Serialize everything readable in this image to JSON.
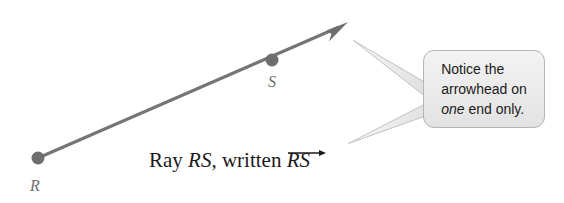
{
  "figure": {
    "name": "ray-diagram",
    "caption_prefix": "Ray ",
    "caption_points": "RS",
    "caption_middle": ", written ",
    "caption_vector": "RS",
    "points": [
      {
        "id": "R",
        "label": "R",
        "x": 38,
        "y": 158,
        "role": "endpoint"
      },
      {
        "id": "S",
        "label": "S",
        "x": 272,
        "y": 60,
        "role": "through-point"
      }
    ],
    "ray": {
      "start_x": 38,
      "start_y": 158,
      "tip_x": 348,
      "tip_y": 22,
      "has_arrowhead_at_start": false,
      "has_arrowhead_at_tip": true,
      "stroke_color": "#757575",
      "stroke_width": 3
    },
    "callout": {
      "line1": "Notice the",
      "line2": "arrowhead on",
      "line3_italic": "one",
      "line3_rest": " end only.",
      "fill_color": "#ebebeb",
      "border_color": "#b4b4b4",
      "text_color": "#1b1b1b",
      "pointer_upper_tip_x": 353,
      "pointer_upper_tip_y": 40,
      "pointer_lower_tip_x": 348,
      "pointer_lower_tip_y": 143
    },
    "colors": {
      "background": "#ffffff",
      "ray": "#757575",
      "point_dot": "#6e6e6e",
      "point_label": "#6e6e6e",
      "caption_text": "#1a1a1a",
      "callout_fill": "#ebebeb",
      "callout_border": "#b4b4b4",
      "callout_tail_fill": "#e4e4e4",
      "callout_tail_stroke": "#c2c2c2"
    }
  }
}
